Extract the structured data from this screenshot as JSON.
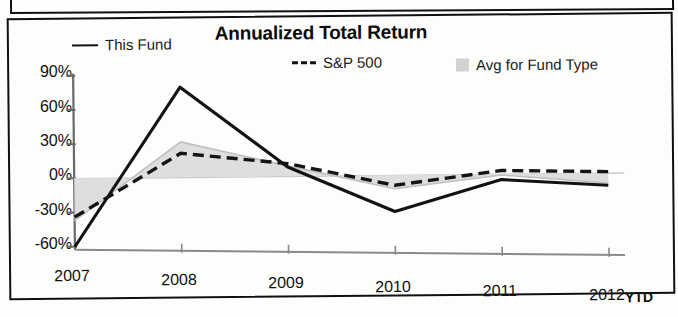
{
  "chart_data": {
    "type": "line",
    "title": "Annualized Total Return",
    "xlabel": "",
    "ylabel": "",
    "categories": [
      "2007",
      "2008",
      "2009",
      "2010",
      "2011",
      "2012"
    ],
    "x_tick_suffix": "YTD",
    "y_ticks": [
      "90%",
      "60%",
      "30%",
      "0%",
      "-30%",
      "-60%"
    ],
    "y_tick_values": [
      90,
      60,
      30,
      0,
      -30,
      -60
    ],
    "ylim": [
      -60,
      90
    ],
    "grid": false,
    "legend_position": "top",
    "series": [
      {
        "name": "This Fund",
        "style": "solid",
        "color": "#141414",
        "values": [
          -60,
          79,
          8,
          -32,
          -5,
          -11
        ]
      },
      {
        "name": "S&P 500",
        "style": "dashed",
        "color": "#141414",
        "values": [
          -34,
          21,
          11,
          -9,
          3,
          1
        ]
      },
      {
        "name": "Avg for Fund Type",
        "style": "band",
        "color": "#d2d2d2",
        "values": [
          -37,
          31,
          9,
          -12,
          -1,
          -9
        ]
      }
    ],
    "band_baseline": 0
  },
  "legend": {
    "items": [
      {
        "label": "This Fund",
        "marker": "solid-line-icon"
      },
      {
        "label": "S&P 500",
        "marker": "dashed-line-icon"
      },
      {
        "label": "Avg for Fund Type",
        "marker": "gray-swatch-icon"
      }
    ]
  },
  "axes": {
    "y": {
      "labels": [
        "90%",
        "60%",
        "30%",
        "0%",
        "-30%",
        "-60%"
      ]
    },
    "x": {
      "labels": [
        "2007",
        "2008",
        "2009",
        "2010",
        "2011",
        "2012"
      ],
      "suffix": "YTD"
    }
  }
}
